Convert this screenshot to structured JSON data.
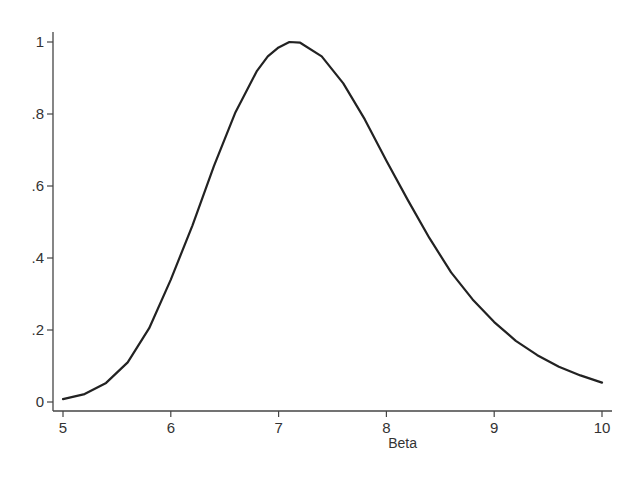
{
  "chart_data": {
    "type": "line",
    "title": "",
    "xlabel": "Beta",
    "ylabel": "",
    "xlim": [
      5,
      10
    ],
    "ylim": [
      0,
      1
    ],
    "grid": false,
    "legend": null,
    "x_ticks": [
      5,
      6,
      7,
      8,
      9,
      10
    ],
    "x_tick_labels": [
      "5",
      "6",
      "7",
      "8",
      "9",
      "10"
    ],
    "y_ticks": [
      0,
      0.2,
      0.4,
      0.6,
      0.8,
      1
    ],
    "y_tick_labels": [
      "0",
      ".2",
      ".4",
      ".6",
      ".8",
      "1"
    ],
    "series": [
      {
        "name": "curve",
        "color": "#222222",
        "x": [
          5.0,
          5.2,
          5.4,
          5.6,
          5.8,
          6.0,
          6.2,
          6.4,
          6.6,
          6.8,
          6.9,
          7.0,
          7.1,
          7.2,
          7.4,
          7.6,
          7.8,
          8.0,
          8.2,
          8.4,
          8.6,
          8.8,
          9.0,
          9.2,
          9.4,
          9.6,
          9.8,
          10.0
        ],
        "y": [
          0.008,
          0.022,
          0.053,
          0.11,
          0.205,
          0.34,
          0.49,
          0.655,
          0.805,
          0.92,
          0.96,
          0.985,
          1.0,
          0.998,
          0.96,
          0.885,
          0.785,
          0.67,
          0.56,
          0.455,
          0.36,
          0.285,
          0.222,
          0.17,
          0.13,
          0.098,
          0.074,
          0.054
        ]
      }
    ]
  },
  "layout": {
    "plot_left": 63,
    "plot_right": 602,
    "y_axis_x": 53,
    "x_axis_y": 411,
    "y_top": 42,
    "y_bottom": 402
  }
}
